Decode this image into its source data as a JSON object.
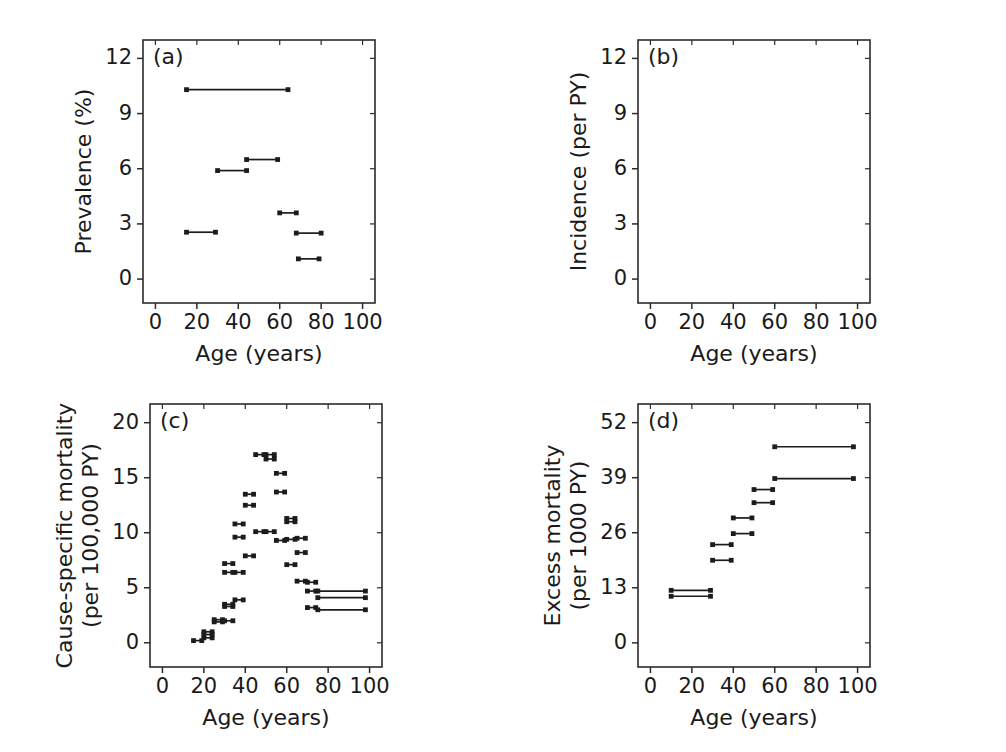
{
  "figure": {
    "width": 1006,
    "height": 752,
    "background": "#ffffff",
    "ink_color": "#1a1a1a",
    "series_color": "#1c1c1c"
  },
  "shared": {
    "xlabel": "Age (years)",
    "xticks": [
      0,
      20,
      40,
      60,
      80,
      100
    ],
    "xlim": [
      -6,
      106
    ]
  },
  "chart_data": [
    {
      "id": "panel-a",
      "type": "line",
      "letter": "(a)",
      "title": "",
      "xlabel": "Age (years)",
      "ylabel": "Prevalence (%)",
      "xlim": [
        -6,
        106
      ],
      "ylim": [
        -1.3,
        13.0
      ],
      "xticks": [
        0,
        20,
        40,
        60,
        80,
        100
      ],
      "yticks": [
        0,
        3,
        6,
        9,
        12
      ],
      "grid": false,
      "legend": "none",
      "note": "Horizontal segments span an age interval at a constant prevalence value; square markers at both ends.",
      "segments": [
        {
          "x0": 15,
          "x1": 64,
          "y": 10.3
        },
        {
          "x0": 44,
          "x1": 59,
          "y": 6.5
        },
        {
          "x0": 30,
          "x1": 44,
          "y": 5.9
        },
        {
          "x0": 60,
          "x1": 68,
          "y": 3.6
        },
        {
          "x0": 15,
          "x1": 29,
          "y": 2.55
        },
        {
          "x0": 68,
          "x1": 80,
          "y": 2.5
        },
        {
          "x0": 69,
          "x1": 79,
          "y": 1.1
        }
      ]
    },
    {
      "id": "panel-b",
      "type": "line",
      "letter": "(b)",
      "title": "",
      "xlabel": "Age (years)",
      "ylabel": "Incidence (per PY)",
      "xlim": [
        -6,
        106
      ],
      "ylim": [
        -1.3,
        13.0
      ],
      "xticks": [
        0,
        20,
        40,
        60,
        80,
        100
      ],
      "yticks": [
        0,
        3,
        6,
        9,
        12
      ],
      "grid": false,
      "legend": "none",
      "note": "Empty panel - no data plotted.",
      "segments": []
    },
    {
      "id": "panel-c",
      "type": "line",
      "letter": "(c)",
      "title": "",
      "xlabel": "Age (years)",
      "ylabel": "Cause-specific mortality\n(per 100,000 PY)",
      "ylabel_line1": "Cause-specific mortality",
      "ylabel_line2": "(per 100,000 PY)",
      "xlim": [
        -6,
        106
      ],
      "ylim": [
        -2.2,
        21.7
      ],
      "xticks": [
        0,
        20,
        40,
        60,
        80,
        100
      ],
      "yticks": [
        0,
        5,
        10,
        15,
        20
      ],
      "grid": false,
      "legend": "none",
      "note": "Many overlapping 5-year age-band segments forming a peak near ages 50-60.",
      "segments": [
        {
          "x0": 15,
          "x1": 19,
          "y": 0.2
        },
        {
          "x0": 20,
          "x1": 24,
          "y": 0.45
        },
        {
          "x0": 20,
          "x1": 24,
          "y": 0.75
        },
        {
          "x0": 20,
          "x1": 24,
          "y": 1.0
        },
        {
          "x0": 25,
          "x1": 29,
          "y": 2.1
        },
        {
          "x0": 25,
          "x1": 29,
          "y": 1.9
        },
        {
          "x0": 30,
          "x1": 34,
          "y": 2.0
        },
        {
          "x0": 30,
          "x1": 34,
          "y": 3.5
        },
        {
          "x0": 30,
          "x1": 34,
          "y": 3.3
        },
        {
          "x0": 35,
          "x1": 39,
          "y": 3.9
        },
        {
          "x0": 30,
          "x1": 34,
          "y": 7.2
        },
        {
          "x0": 30,
          "x1": 34,
          "y": 6.4
        },
        {
          "x0": 35,
          "x1": 39,
          "y": 6.4
        },
        {
          "x0": 35,
          "x1": 39,
          "y": 10.8
        },
        {
          "x0": 35,
          "x1": 39,
          "y": 9.6
        },
        {
          "x0": 40,
          "x1": 44,
          "y": 13.5
        },
        {
          "x0": 40,
          "x1": 44,
          "y": 12.5
        },
        {
          "x0": 40,
          "x1": 44,
          "y": 7.9
        },
        {
          "x0": 45,
          "x1": 49,
          "y": 17.1
        },
        {
          "x0": 50,
          "x1": 54,
          "y": 17.1
        },
        {
          "x0": 50,
          "x1": 54,
          "y": 16.7
        },
        {
          "x0": 45,
          "x1": 49,
          "y": 10.1
        },
        {
          "x0": 50,
          "x1": 54,
          "y": 10.1
        },
        {
          "x0": 55,
          "x1": 59,
          "y": 15.4
        },
        {
          "x0": 55,
          "x1": 59,
          "y": 13.7
        },
        {
          "x0": 55,
          "x1": 59,
          "y": 9.3
        },
        {
          "x0": 60,
          "x1": 64,
          "y": 11.3
        },
        {
          "x0": 60,
          "x1": 64,
          "y": 11.0
        },
        {
          "x0": 60,
          "x1": 64,
          "y": 9.4
        },
        {
          "x0": 60,
          "x1": 64,
          "y": 7.1
        },
        {
          "x0": 65,
          "x1": 69,
          "y": 9.5
        },
        {
          "x0": 65,
          "x1": 69,
          "y": 8.2
        },
        {
          "x0": 65,
          "x1": 69,
          "y": 5.6
        },
        {
          "x0": 70,
          "x1": 74,
          "y": 5.5
        },
        {
          "x0": 70,
          "x1": 74,
          "y": 4.7
        },
        {
          "x0": 70,
          "x1": 74,
          "y": 3.2
        },
        {
          "x0": 75,
          "x1": 98,
          "y": 4.7
        },
        {
          "x0": 75,
          "x1": 98,
          "y": 4.1
        },
        {
          "x0": 75,
          "x1": 98,
          "y": 3.0
        }
      ]
    },
    {
      "id": "panel-d",
      "type": "line",
      "letter": "(d)",
      "title": "",
      "xlabel": "Age (years)",
      "ylabel": "Excess mortality\n(per 1000 PY)",
      "ylabel_line1": "Excess mortality",
      "ylabel_line2": "(per 1000 PY)",
      "xlim": [
        -6,
        106
      ],
      "ylim": [
        -5.7,
        56.4
      ],
      "xticks": [
        0,
        20,
        40,
        60,
        80,
        100
      ],
      "yticks": [
        0,
        13,
        26,
        39,
        52
      ],
      "grid": false,
      "legend": "none",
      "note": "Step-like increasing segments by age band, two overlapping series.",
      "segments": [
        {
          "x0": 10,
          "x1": 29,
          "y": 12.4
        },
        {
          "x0": 10,
          "x1": 29,
          "y": 11.0
        },
        {
          "x0": 30,
          "x1": 39,
          "y": 23.2
        },
        {
          "x0": 30,
          "x1": 39,
          "y": 19.5
        },
        {
          "x0": 40,
          "x1": 49,
          "y": 29.5
        },
        {
          "x0": 40,
          "x1": 49,
          "y": 25.8
        },
        {
          "x0": 50,
          "x1": 59,
          "y": 36.2
        },
        {
          "x0": 50,
          "x1": 59,
          "y": 33.1
        },
        {
          "x0": 60,
          "x1": 98,
          "y": 46.3
        },
        {
          "x0": 60,
          "x1": 98,
          "y": 38.8
        }
      ]
    }
  ]
}
